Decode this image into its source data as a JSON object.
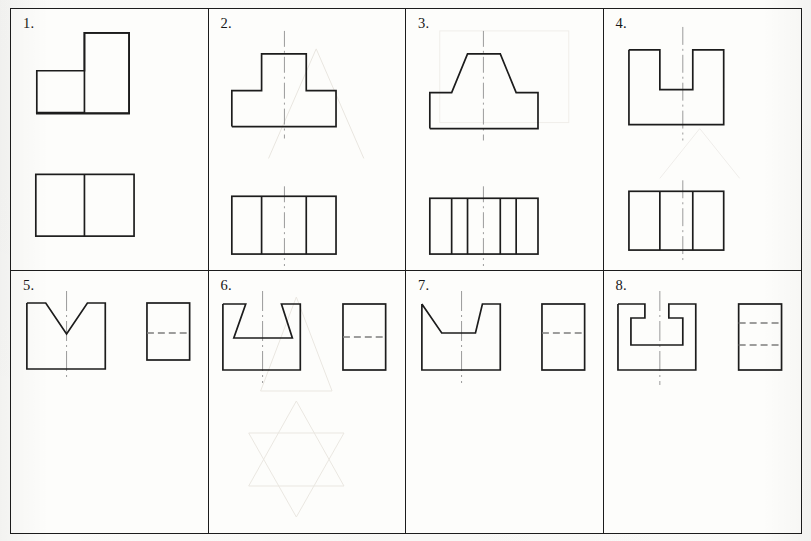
{
  "sheet": {
    "title": "Orthographic projection exercise sheet",
    "line_color": "#1c1c1c",
    "centerline_color": "#8e8e8e",
    "hidden_line_color": "#7d7d7d",
    "ghost_color": "#e7e4de",
    "paper_color": "#fbfbf9",
    "rows": 2,
    "columns": 4
  },
  "cells": [
    {
      "number": "1.",
      "name": "cell-1",
      "views": [
        "front-view-l-step-block",
        "top-view-divided-rectangle"
      ],
      "has_centerline": false,
      "hidden_lines": 0,
      "divider_count": 1
    },
    {
      "number": "2.",
      "name": "cell-2",
      "views": [
        "front-view-tee-block",
        "top-view-divided-rectangle"
      ],
      "has_centerline": true,
      "hidden_lines": 0,
      "divider_count": 2
    },
    {
      "number": "3.",
      "name": "cell-3",
      "views": [
        "front-view-truncated-pyramid-block",
        "top-view-divided-rectangle"
      ],
      "has_centerline": true,
      "hidden_lines": 0,
      "divider_count": 4
    },
    {
      "number": "4.",
      "name": "cell-4",
      "views": [
        "front-view-u-notch-block",
        "top-view-divided-rectangle"
      ],
      "has_centerline": true,
      "hidden_lines": 0,
      "divider_count": 2
    },
    {
      "number": "5.",
      "name": "cell-5",
      "views": [
        "front-view-vee-notch-block",
        "side-view-rectangle-hidden-line"
      ],
      "has_centerline": true,
      "hidden_lines": 1,
      "divider_count": 0
    },
    {
      "number": "6.",
      "name": "cell-6",
      "views": [
        "front-view-dovetail-notch-block",
        "side-view-rectangle-hidden-line"
      ],
      "has_centerline": true,
      "hidden_lines": 1,
      "divider_count": 0
    },
    {
      "number": "7.",
      "name": "cell-7",
      "views": [
        "front-view-vee-trough-block",
        "side-view-rectangle-hidden-line"
      ],
      "has_centerline": true,
      "hidden_lines": 1,
      "divider_count": 0
    },
    {
      "number": "8.",
      "name": "cell-8",
      "views": [
        "front-view-tee-slot-block",
        "side-view-rectangle-two-hidden-lines"
      ],
      "has_centerline": true,
      "hidden_lines": 2,
      "divider_count": 0
    }
  ]
}
